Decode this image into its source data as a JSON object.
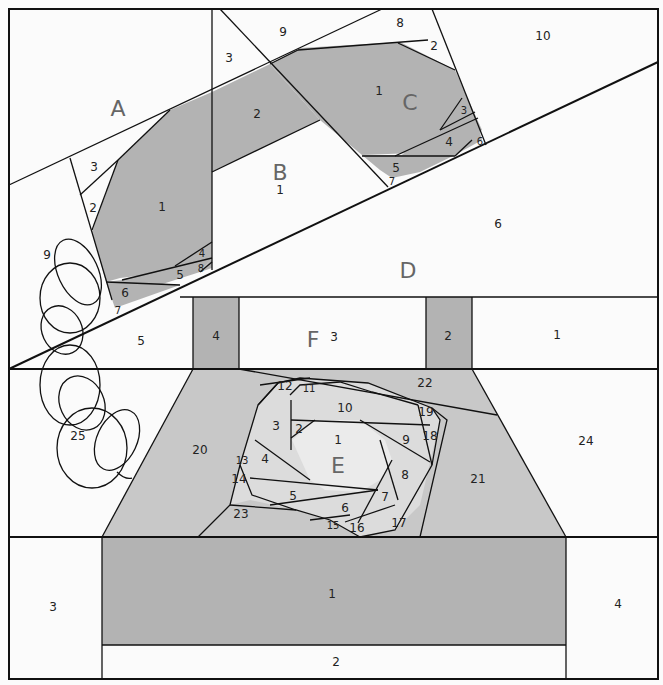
{
  "diagram": {
    "colors": {
      "dark": "#b3b3b3",
      "medium": "#c8c8c8",
      "light": "#dcdcdc",
      "background": "#fbfbfb",
      "line": "#111111"
    },
    "sections": {
      "A": {
        "letter": "A",
        "pieces": {
          "p1": "1",
          "p2": "2",
          "p3": "3",
          "p4": "4",
          "p5": "5",
          "p6": "6",
          "p7": "7",
          "p8": "8",
          "p9": "9"
        }
      },
      "B": {
        "letter": "B",
        "pieces": {
          "p1": "1",
          "p2": "2",
          "p3": "3",
          "p9": "9"
        }
      },
      "C": {
        "letter": "C",
        "pieces": {
          "p1": "1",
          "p2": "2",
          "p3": "3",
          "p4": "4",
          "p5": "5",
          "p6": "6",
          "p7": "7",
          "p8": "8",
          "p10": "10"
        }
      },
      "D": {
        "letter": "D",
        "pieces": {
          "p5": "5",
          "p6": "6"
        }
      },
      "F": {
        "letter": "F",
        "pieces": {
          "p1": "1",
          "p2": "2",
          "p3": "3",
          "p4": "4"
        }
      },
      "E": {
        "letter": "E",
        "pieces": {
          "p1": "1",
          "p2": "2",
          "p3": "3",
          "p4": "4",
          "p5": "5",
          "p6": "6",
          "p7": "7",
          "p8": "8",
          "p9": "9",
          "p10": "10",
          "p11": "11",
          "p12": "12",
          "p13": "13",
          "p14": "14",
          "p15": "15",
          "p16": "16",
          "p17": "17",
          "p18": "18",
          "p19": "19",
          "p20": "20",
          "p21": "21",
          "p22": "22",
          "p23": "23",
          "p24": "24",
          "p25": "25"
        }
      },
      "G": {
        "pieces": {
          "p1": "1",
          "p2": "2",
          "p3": "3",
          "p4": "4"
        }
      }
    }
  }
}
